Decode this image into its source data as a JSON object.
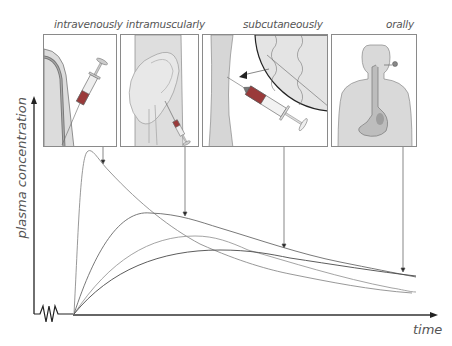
{
  "diagram": {
    "routes": [
      {
        "id": "iv",
        "label": "intravenously"
      },
      {
        "id": "im",
        "label": "intramuscularly"
      },
      {
        "id": "sc",
        "label": "subcutaneously"
      },
      {
        "id": "oral",
        "label": "orally"
      }
    ],
    "axes": {
      "y_label": "plasma concentration",
      "x_label": "time"
    },
    "colors": {
      "panel_border": "#8a8a8a",
      "skin_fill": "#d9d9d9",
      "curve_gray": "#8c8c8c",
      "curve_dark": "#5a5a5a",
      "axis": "#333333",
      "syringe_red": "#9a3a3a"
    }
  }
}
